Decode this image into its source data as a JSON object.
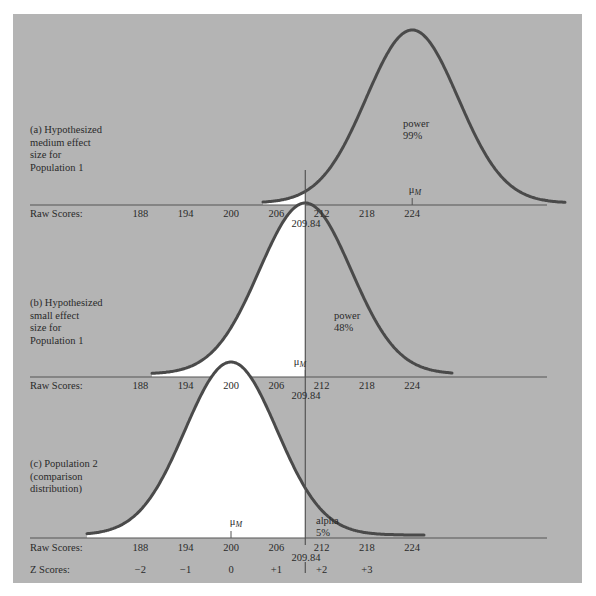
{
  "panels": {
    "a": {
      "label": "(a) Hypothesized\nmedium effect\nsize for\nPopulation 1",
      "region_label": "power",
      "region_value": "99%",
      "mean_label": "μ",
      "mean_sub": "M",
      "mean": 224
    },
    "b": {
      "label": "(b) Hypothesized\nsmall effect\nsize for\nPopulation 1",
      "region_label": "power",
      "region_value": "48%",
      "mean_label": "μ",
      "mean_sub": "M",
      "mean": 209.84
    },
    "c": {
      "label": "(c) Population 2\n(comparison\ndistribution)",
      "region_label": "alpha",
      "region_value": "5%",
      "mean_label": "μ",
      "mean_sub": "M",
      "mean": 200
    }
  },
  "axis": {
    "raw_label": "Raw Scores:",
    "z_label": "Z Scores:",
    "raw_ticks": [
      "188",
      "194",
      "200",
      "206",
      "212",
      "218",
      "224"
    ],
    "z_ticks": [
      "−2",
      "−1",
      "0",
      "+1",
      "+2",
      "+3"
    ],
    "cutoff": "209.84"
  },
  "colors": {
    "panel_bg": "#b4b4b4",
    "curve": "#4a4a4a",
    "fill": "#ffffff",
    "axis": "#555555"
  },
  "chart_data": {
    "type": "area",
    "title": "",
    "xlabel": "Raw Scores / Z Scores",
    "ylabel": "",
    "cutoff_raw_score": 209.84,
    "raw_score_ticks": [
      188,
      194,
      200,
      206,
      212,
      218,
      224
    ],
    "z_score_ticks": [
      -2,
      -1,
      0,
      1,
      2,
      3
    ],
    "series": [
      {
        "name": "(a) Hypothesized medium effect size for Population 1",
        "distribution": "normal",
        "mean": 224,
        "shaded_region": "power",
        "value_percent": 99
      },
      {
        "name": "(b) Hypothesized small effect size for Population 1",
        "distribution": "normal",
        "mean": 209.84,
        "shaded_region": "power",
        "value_percent": 48
      },
      {
        "name": "(c) Population 2 (comparison distribution)",
        "distribution": "normal",
        "mean": 200,
        "shaded_region": "alpha",
        "value_percent": 5
      }
    ]
  }
}
